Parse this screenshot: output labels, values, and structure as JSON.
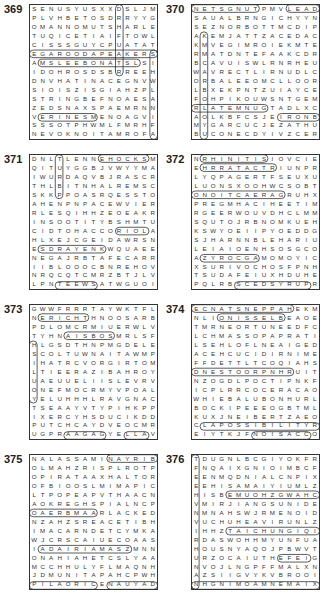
{
  "puzzles": [
    {
      "number": "369",
      "rows": [
        "SENUSYUSXXDSLJM",
        "PLVHBETOSDRRYYG",
        "OMANNOMUTSHARLE",
        "TUQICETIAIFTOWL",
        "CISSSGUYCPUATAT",
        "EGAROODAPEAKERS",
        "AMSLEEBONATSLSI",
        "IDOHROSDSBRREEH",
        "DNVHATINACEGNVW",
        "SIOISZISGIAHZPL",
        "STRINGBEFNOAESA",
        "ZEDSNAXSPAEMRNN",
        "VERINESMENOAGVI",
        "SSSOTPHWMLFMRHF",
        "NEVOKNOITAMROFA"
      ]
    },
    {
      "number": "370",
      "rows": [
        "NETSGNUTPMVLEAD",
        "SAUALBRNGICHYYN",
        "SEZNORBOTTMCDIP",
        "AKEMJATTZACEDAC",
        "KMVEGIMROIEKMTE",
        "RMATDNTEFAAKCDR",
        "BCAVUISWLRNRHEU",
        "WAVRECTLIRNUDLC",
        "ORBALEEOMCLLOOR",
        "LBXEKPNTZUIAYCE",
        "FOHPIKOUWSNTGEM",
        "RLATEMNUGTADLXC",
        "AOLKBFCSJEIRONB",
        "MYGARCUCJEZATHU",
        "BUCONECDYIVZCER"
      ]
    },
    {
      "number": "371",
      "rows": [
        "DNLTLENNEHOCKSM",
        "QITUYGGBJVWYYMA",
        "IWURDAQVBJRASCR",
        "THLBITNHALREMSC",
        "SKKPPOASRQESSTO",
        "AHENPNPACEWVIER",
        "RLESQIHHZEOEAKR",
        "INSOOTITYBSHMTU",
        "CIDTOHACCORIOLAN",
        "HLXEJCGEIDAWRSN",
        "ESDRAYENKWQUAEE",
        "NEGAJRBTAFECARR",
        "IIBLOOOCBNREHOV",
        "NRQCQTCMRZBTJLV",
        "LPNTEEWSATWGUOI"
      ]
    },
    {
      "number": "372",
      "rows": [
        "NRHINITISIOVCIE",
        "EHRRATACTRIUNPR",
        "LYQPAGERTFSEUXU",
        "LUONSXOOHWCSOBT",
        "ONOITCAERAGRUHX",
        "PREGMHACIHEETIM",
        "RGEERWOUVDHCLMM",
        "SQUTOJRBNOMKUEH",
        "KSWYOEIIPYOEDDG",
        "SJHARNNBLEHARIU",
        "LEIAIOENHSOSGCO",
        "AZYROCGAMOMOYIC",
        "XSURIVOCHOSFPNH",
        "TSUDAFEIUXHDUHE",
        "PQLRBSCEDSYRUPR"
      ]
    },
    {
      "number": "373",
      "rows": [
        "GWWFRRRTAYWKTFL",
        "NERICHTHNOOSARB",
        "PDLOMCRMIUERWLV",
        "TYHNAISBOSMRLSF",
        "HLGSDTHNPMGDELE",
        "SCOLTUWNAITAWMP",
        "IHATRCVORGIRTOM",
        "LTIEERAZIBAHROY",
        "UAEUUELIISLEVRV",
        "ONEFMOCRMYVPOAL",
        "YELUHHHLRAVGNAC",
        "TSEAAYVTYPIHKPP",
        "IXERCYHSDUCIKDD",
        "PUTCHCAYDVEOCMR",
        "UGPRAAGAGYELLAV"
      ]
    },
    {
      "number": "374",
      "rows": [
        "ECNATSNEPPAHEKM",
        "NLIONISSELBEAOE",
        "TMRNEORTUNEEDFC",
        "LCHMASSOPAPRATI",
        "LSEHLOFLNEAIGED",
        "ACEHCUCIDIRNIME",
        "FFDETTLTCOQIAHS",
        "DNESTOORPNHRUIT",
        "NZOGDLPOCTIPNKF",
        "ICPLRRCOCERACAO",
        "WHIEBALUBONHURL",
        "BOCKIPEEEOGBTML",
        "KUXJNEIBERTZAEO",
        "CLAPOSSIBILITYR",
        "EIYTKJFNOISACCO"
      ]
    },
    {
      "number": "375",
      "rows": [
        "NALASSAMINAYRIB",
        "OLMAHZRISPLROTP",
        "OPIRATAAXHALTOR",
        "OFBIOOSLMIMAPIC",
        "LTPOPEAPVTHAACN",
        "AOKREGHSPIALNCP",
        "OAERBMAARLACKED",
        "NZAHZSREACETIBH",
        "IMACARNDETCYMKA",
        "WJCRSCAIUECOAAS",
        "IADAIRIAMASZMNN",
        "ONAHIAHETCSLYAA",
        "MCCHHULYFLMAQNH",
        "JDMUNITAPAHCPWH",
        "PILAORICENAUYAD"
      ]
    },
    {
      "number": "376",
      "rows": [
        "TDUGNLBCGIYOKFR",
        "FNQAIXGNIOIMBCF",
        "EENMQDNIALCNPIX",
        "EEHISAMAIYIUMLZ",
        "HISBEMUOHZGWAHC",
        "VMIRJIANGSUNIDE",
        "NMNAHSWJRMENOID",
        "VUCHUHEAVIRUNLZ",
        "IHHZTAICHUNGIQI",
        "RDASWOHHMYUNFUA",
        "HOUSNYAQOJPBWVT",
        "URZOCAIUTHEFEIG",
        "NVOJLNGPFFMALXN",
        "AZSIIGVYKVBROOI",
        "NHGNIMOAMNEMAIX"
      ]
    }
  ]
}
